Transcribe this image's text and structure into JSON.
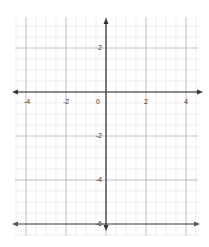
{
  "diagram": {
    "type": "coordinate-grid",
    "x_ticks": [
      {
        "label": "-4",
        "x": 27
      },
      {
        "label": "-2",
        "x": 66
      },
      {
        "label": "0",
        "x": 98
      },
      {
        "label": "2",
        "x": 146
      },
      {
        "label": "4",
        "x": 186
      }
    ],
    "y_ticks": [
      {
        "label": "2",
        "y": 50
      },
      {
        "label": "-2",
        "y": 138
      },
      {
        "label": "-4",
        "y": 182
      },
      {
        "label": "-6",
        "y": 226
      }
    ],
    "colors": {
      "axis": "#333333",
      "major_grid": "#b0b0b0",
      "minor_grid": "#e2e2e2"
    }
  }
}
